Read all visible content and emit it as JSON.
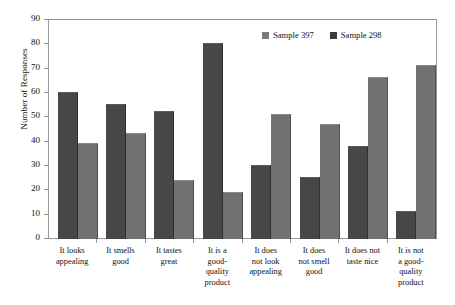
{
  "chart_data": {
    "type": "bar",
    "title": "",
    "xlabel": "",
    "ylabel": "Number of Responses",
    "ylim": [
      0,
      90
    ],
    "ytick_step": 10,
    "yticks": [
      90,
      80,
      70,
      60,
      50,
      40,
      30,
      20,
      10,
      0
    ],
    "grid": false,
    "legend_position": "top-right",
    "categories": [
      "It looks appealing",
      "It smells good",
      "It tastes great",
      "It is a good-quality product",
      "It does not look appealing",
      "It does not smell good",
      "It does not taste nice",
      "It is not a good-quality product"
    ],
    "category_label_lines": [
      [
        "It looks",
        "appealing"
      ],
      [
        "It smells",
        "good"
      ],
      [
        "It tastes",
        "great"
      ],
      [
        "It is a",
        "good-",
        "quality",
        "product"
      ],
      [
        "It does",
        "not look",
        "appealing"
      ],
      [
        "It does",
        "not smell",
        "good"
      ],
      [
        "It does not",
        "taste nice"
      ],
      [
        "It is not",
        "a good-",
        "quality",
        "product"
      ]
    ],
    "series": [
      {
        "name": "Sample 298",
        "color": "#474747",
        "legend_color": "#3b3b3b",
        "draw_order": 1,
        "values": [
          60,
          55,
          52,
          80,
          30,
          25,
          38,
          11
        ]
      },
      {
        "name": "Sample 397",
        "color": "#717171",
        "legend_color": "#7a7a7a",
        "draw_order": 2,
        "values": [
          39,
          43,
          24,
          19,
          51,
          47,
          66,
          71
        ]
      }
    ]
  },
  "legend": {
    "entries": [
      {
        "label": "Sample 397",
        "swatch": "light"
      },
      {
        "label": "Sample 298",
        "swatch": "dark"
      }
    ]
  },
  "axis": {
    "y_title": "Number of Responses"
  }
}
